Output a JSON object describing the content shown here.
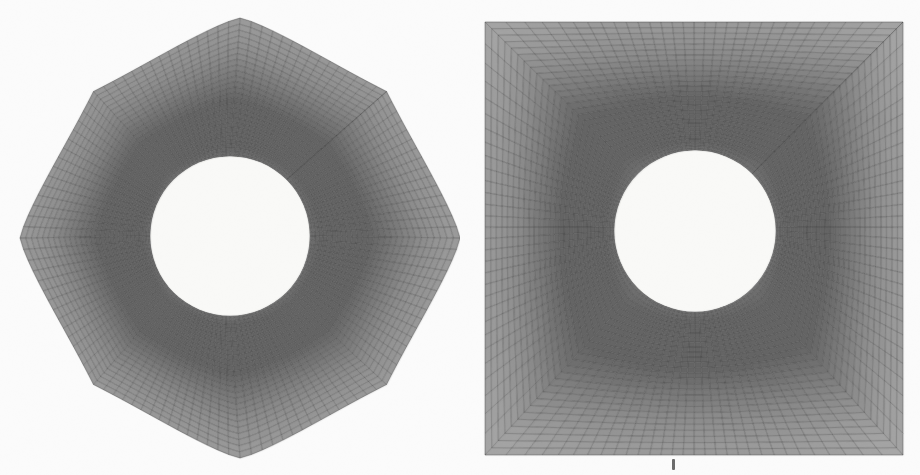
{
  "figure": {
    "background_color": "#ffffff",
    "paper_tint": "#fbfbf9",
    "width": 920,
    "height": 475,
    "mesh_line_color": "#3f3f3f",
    "mesh_fill_light": "#b4b4b4",
    "mesh_fill_dark": "#6e6e6e",
    "hole_color": "#fdfdfb"
  },
  "panels": [
    {
      "id": "left-mesh",
      "name": "astroid-boundary-mesh",
      "caption": "",
      "boundary_shape": "concave-square (astroid-like), cusped corners",
      "origin_x": 20,
      "origin_y": 18,
      "extent_x": 440,
      "extent_y": 440,
      "hole_center_x": 230,
      "hole_center_y": 236,
      "hole_radius": 79,
      "radial_cells": 28,
      "angular_cells": 120,
      "waist_inset": 30,
      "corner_overshoot": 0
    },
    {
      "id": "right-mesh",
      "name": "square-boundary-mesh",
      "caption": "",
      "boundary_shape": "square",
      "origin_x": 485,
      "origin_y": 22,
      "extent_x": 418,
      "extent_y": 433,
      "hole_center_x": 695,
      "hole_center_y": 231,
      "hole_radius": 80,
      "radial_cells": 28,
      "angular_cells": 120,
      "waist_inset": 0,
      "corner_overshoot": 0
    }
  ],
  "annotations": [
    {
      "name": "bottom-tick-mark",
      "label": "",
      "x": 672,
      "y": 459,
      "description": "small vertical scan artifact / partial glyph below right panel"
    }
  ],
  "chart_data": {
    "type": "diagram",
    "subtitle": "",
    "xlabel": "",
    "ylabel": "",
    "legend": [],
    "series": [
      {
        "name": "left-mesh",
        "outer_boundary": "astroid",
        "inner_boundary": "circle",
        "radial_divisions": 28,
        "angular_divisions": 120
      },
      {
        "name": "right-mesh",
        "outer_boundary": "square",
        "inner_boundary": "circle",
        "radial_divisions": 28,
        "angular_divisions": 120
      }
    ]
  }
}
